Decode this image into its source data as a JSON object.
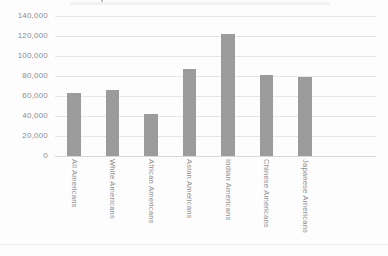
{
  "chart_data": {
    "type": "bar",
    "title": "",
    "xlabel": "",
    "ylabel": "",
    "categories": [
      "All Americans",
      "White Americans",
      "African Americans",
      "Asian Americans",
      "Indian Americans",
      "Chinese Americans",
      "Japanese Americans"
    ],
    "values": [
      62500,
      66000,
      42000,
      87000,
      122000,
      80500,
      79000
    ],
    "ylim": [
      0,
      140000
    ],
    "y_ticks": [
      0,
      20000,
      40000,
      60000,
      80000,
      100000,
      120000,
      140000
    ],
    "y_tick_labels": [
      "0",
      "20,000",
      "40,000",
      "60,000",
      "80,000",
      "100,000",
      "120,000",
      "140,000"
    ],
    "grid": "horizontal",
    "legend": "none",
    "colors": {
      "bar": "#9b9b9b",
      "gridline": "#e6e6e6",
      "axis_line": "#d8d8d8",
      "tick_text": "#8c8c8c",
      "category_text": "#8f8f8f",
      "background": "#fdfdfd"
    }
  }
}
